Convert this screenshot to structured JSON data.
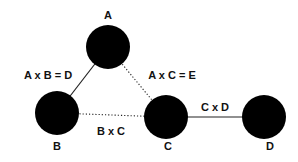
{
  "diagram": {
    "nodes": [
      {
        "id": "A",
        "label": "A",
        "cx": 108,
        "cy": 47,
        "r": 22,
        "label_x": 108,
        "label_y": 19
      },
      {
        "id": "B",
        "label": "B",
        "cx": 57,
        "cy": 113,
        "r": 22,
        "label_x": 57,
        "label_y": 150
      },
      {
        "id": "C",
        "label": "C",
        "cx": 166,
        "cy": 117,
        "r": 22,
        "label_x": 168,
        "label_y": 150
      },
      {
        "id": "D",
        "label": "D",
        "cx": 264,
        "cy": 117,
        "r": 22,
        "label_x": 270,
        "label_y": 150
      }
    ],
    "edges": [
      {
        "from": "A",
        "to": "B",
        "style": "solid",
        "label": "A x B = D",
        "label_x": 48,
        "label_y": 79
      },
      {
        "from": "A",
        "to": "C",
        "style": "dotted",
        "label": "A x C = E",
        "label_x": 172,
        "label_y": 79
      },
      {
        "from": "B",
        "to": "C",
        "style": "dotted",
        "label": "B x C",
        "label_x": 111,
        "label_y": 135
      },
      {
        "from": "C",
        "to": "D",
        "style": "solid",
        "label": "C x D",
        "label_x": 215,
        "label_y": 111
      }
    ],
    "colors": {
      "node": "#000000",
      "edge": "#222222",
      "text": "#111111",
      "background": "#ffffff"
    }
  }
}
